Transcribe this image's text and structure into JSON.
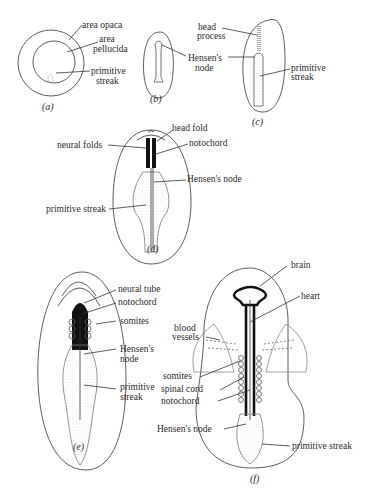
{
  "figure": {
    "panels": [
      {
        "id": "a",
        "caption": "(a)",
        "labels": [
          "area opaca",
          "area pellucida",
          "primitive streak"
        ]
      },
      {
        "id": "b",
        "caption": "(b)",
        "labels": [
          "Hensen's node"
        ]
      },
      {
        "id": "c",
        "caption": "(c)",
        "labels": [
          "head process",
          "Hensen's node",
          "primitive streak"
        ]
      },
      {
        "id": "d",
        "caption": "(d)",
        "labels": [
          "head fold",
          "neural folds",
          "notochord",
          "Hensen's node",
          "primitive streak"
        ]
      },
      {
        "id": "e",
        "caption": "(e)",
        "labels": [
          "neural tube",
          "notochord",
          "somites",
          "Hensen's node",
          "primitive streak"
        ]
      },
      {
        "id": "f",
        "caption": "(f)",
        "labels": [
          "brain",
          "heart",
          "blood vessels",
          "somites",
          "spinal cord",
          "notochord",
          "Hensen's node",
          "primitive streak"
        ]
      }
    ]
  },
  "a": {
    "area_opaca": "area opaca",
    "area_pellucida_1": "area",
    "area_pellucida_2": "pellucida",
    "ps_1": "primitive",
    "ps_2": "streak",
    "caption": "(a)"
  },
  "b": {
    "hn_1": "Hensen's",
    "hn_2": "node",
    "caption": "(b)"
  },
  "c": {
    "hp_1": "head",
    "hp_2": "process",
    "ps_1": "primitive",
    "ps_2": "streak",
    "caption": "(c)"
  },
  "d": {
    "head_fold": "head fold",
    "neural_folds": "neural folds",
    "notochord": "notochord",
    "hensens_node": "Hensen's node",
    "primitive_streak": "primitive streak",
    "caption": "(d)"
  },
  "e": {
    "neural_tube": "neural tube",
    "notochord": "notochord",
    "somites": "somites",
    "hn_1": "Hensen's",
    "hn_2": "node",
    "ps_1": "primitive",
    "ps_2": "streak",
    "caption": "(e)"
  },
  "f": {
    "brain": "brain",
    "heart": "heart",
    "bv_1": "blood",
    "bv_2": "vessels",
    "somites": "somites",
    "spinal_cord": "spinal cord",
    "notochord": "notochord",
    "hensens_node": "Hensen's node",
    "primitive_streak": "primitive streak",
    "caption": "(f)"
  }
}
